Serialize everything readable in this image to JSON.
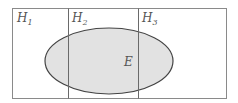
{
  "diagram": {
    "partitions": [
      {
        "name": "H",
        "sub": "1"
      },
      {
        "name": "H",
        "sub": "2"
      },
      {
        "name": "H",
        "sub": "3"
      }
    ],
    "event": {
      "label": "E"
    },
    "colors": {
      "border": "#8a8a8a",
      "ellipse_fill": "#e2e2e2",
      "ellipse_stroke": "#444444"
    }
  }
}
